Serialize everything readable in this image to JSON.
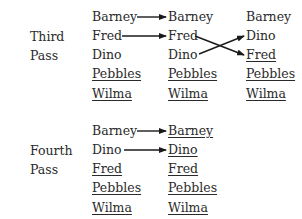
{
  "passes": [
    {
      "label_line1": "Third",
      "label_line2": "Pass",
      "columns": [
        {
          "items": [
            {
              "name": "Barney",
              "sorted": false
            },
            {
              "name": "Fred",
              "sorted": false
            },
            {
              "name": "Dino",
              "sorted": false
            },
            {
              "name": "Pebbles",
              "sorted": true
            },
            {
              "name": "Wilma",
              "sorted": true
            }
          ]
        },
        {
          "items": [
            {
              "name": "Barney",
              "sorted": false
            },
            {
              "name": "Fred",
              "sorted": false
            },
            {
              "name": "Dino",
              "sorted": false
            },
            {
              "name": "Pebbles",
              "sorted": true
            },
            {
              "name": "Wilma",
              "sorted": true
            }
          ]
        },
        {
          "items": [
            {
              "name": "Barney",
              "sorted": false
            },
            {
              "name": "Dino",
              "sorted": false
            },
            {
              "name": "Fred",
              "sorted": true
            },
            {
              "name": "Pebbles",
              "sorted": true
            },
            {
              "name": "Wilma",
              "sorted": true
            }
          ]
        }
      ]
    },
    {
      "label_line1": "Fourth",
      "label_line2": "Pass",
      "columns": [
        {
          "items": [
            {
              "name": "Barney",
              "sorted": false
            },
            {
              "name": "Dino",
              "sorted": false
            },
            {
              "name": "Fred",
              "sorted": true
            },
            {
              "name": "Pebbles",
              "sorted": true
            },
            {
              "name": "Wilma",
              "sorted": true
            }
          ]
        },
        {
          "items": [
            {
              "name": "Barney",
              "sorted": true
            },
            {
              "name": "Dino",
              "sorted": true
            },
            {
              "name": "Fred",
              "sorted": true
            },
            {
              "name": "Pebbles",
              "sorted": true
            },
            {
              "name": "Wilma",
              "sorted": true
            }
          ]
        }
      ]
    }
  ]
}
